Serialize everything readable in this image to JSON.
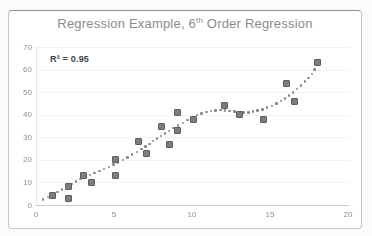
{
  "chart": {
    "title_prefix": "Regression Example, 6",
    "title_sup": "th",
    "title_suffix": " Order Regression",
    "annotation": "R² = 0.95"
  },
  "chart_data": {
    "type": "scatter",
    "title": "Regression Example, 6th Order Regression",
    "annotation": "R² = 0.95",
    "legend": "none",
    "grid": "faint horizontal",
    "x_axis": {
      "min": 0,
      "max": 20,
      "ticks": [
        0,
        5,
        10,
        15,
        20
      ]
    },
    "y_axis": {
      "min": 0,
      "max": 70,
      "ticks": [
        0,
        10,
        20,
        30,
        40,
        50,
        60,
        70
      ]
    },
    "points": [
      [
        1,
        4
      ],
      [
        2,
        3
      ],
      [
        2,
        8
      ],
      [
        3,
        13
      ],
      [
        3.5,
        10
      ],
      [
        5,
        13
      ],
      [
        5,
        20
      ],
      [
        6.5,
        28
      ],
      [
        7,
        23
      ],
      [
        8,
        35
      ],
      [
        8.5,
        27
      ],
      [
        9,
        33
      ],
      [
        9,
        41
      ],
      [
        10,
        38
      ],
      [
        12,
        44
      ],
      [
        13,
        40
      ],
      [
        14.5,
        38
      ],
      [
        16,
        54
      ],
      [
        16.5,
        46
      ],
      [
        18,
        63
      ]
    ],
    "trendline": {
      "style": "dotted",
      "order": "6th order polynomial",
      "samples": [
        [
          0.4,
          2.5
        ],
        [
          1.5,
          6.5
        ],
        [
          2.5,
          10.5
        ],
        [
          3.5,
          13.5
        ],
        [
          4.5,
          16.5
        ],
        [
          5.5,
          20
        ],
        [
          6.5,
          24
        ],
        [
          7.5,
          28.5
        ],
        [
          8.5,
          33
        ],
        [
          9.5,
          37
        ],
        [
          10.5,
          40.5
        ],
        [
          11.5,
          42
        ],
        [
          12.5,
          41.5
        ],
        [
          13.5,
          41
        ],
        [
          14.5,
          42.5
        ],
        [
          15.5,
          45.5
        ],
        [
          16.5,
          50.5
        ],
        [
          17.5,
          57
        ],
        [
          18.1,
          64
        ]
      ]
    },
    "colors": {
      "marker_fill": "#7d7d7d",
      "marker_border": "#5e5e5e",
      "trendline": "#8a8a8a",
      "title_text": "#8c8c8c",
      "tick_label_text": "#8f8f8f",
      "annotation_text": "#3f3f3f"
    }
  }
}
